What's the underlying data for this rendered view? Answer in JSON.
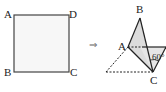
{
  "figure_left": {
    "shape": "square",
    "labels": {
      "A": "A",
      "B": "B",
      "C": "C",
      "D": "D"
    },
    "fill": "#f7f7f7",
    "stroke": "#444444"
  },
  "arrow": {
    "symbol": "⇒"
  },
  "figure_right": {
    "labels": {
      "A": "A",
      "B": "B",
      "C": "C"
    },
    "angle_label": "60°",
    "shaded_fill": "#dcdcdc",
    "stroke": "#222222"
  }
}
